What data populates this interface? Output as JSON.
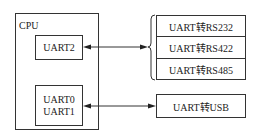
{
  "cpu": {
    "label": "CPU"
  },
  "uart2": {
    "label": "UART2"
  },
  "uart01": {
    "line1": "UART0",
    "line2": "UART1"
  },
  "converters": [
    {
      "label": "UART转RS232"
    },
    {
      "label": "UART转RS422"
    },
    {
      "label": "UART转RS485"
    }
  ],
  "usb": {
    "label": "UART转USB"
  }
}
